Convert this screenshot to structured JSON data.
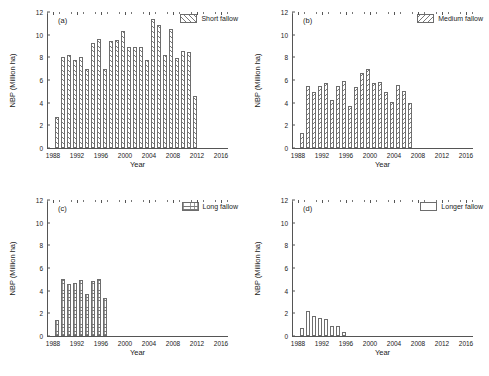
{
  "figure": {
    "axis_labels": {
      "x": "Year",
      "y": "NBP (Million ha)"
    },
    "y_ticks": [
      "0",
      "2",
      "4",
      "6",
      "8",
      "10",
      "12"
    ],
    "x_ticks": [
      "1988",
      "1992",
      "1996",
      "2000",
      "2004",
      "2008",
      "2012",
      "2016"
    ]
  },
  "chart_data": [
    {
      "type": "bar",
      "panel": "(a)",
      "title": "",
      "legend": "Short fallow",
      "hatch": "forward-slash",
      "xlabel": "Year",
      "ylabel": "NBP (Million ha)",
      "xlim": [
        1987,
        2017
      ],
      "ylim": [
        0,
        12
      ],
      "x": [
        1988,
        1989,
        1990,
        1991,
        1992,
        1993,
        1994,
        1995,
        1996,
        1997,
        1998,
        1999,
        2000,
        2001,
        2002,
        2003,
        2004,
        2005,
        2006,
        2007,
        2008,
        2009,
        2010,
        2011
      ],
      "values": [
        2.75,
        8.0,
        8.2,
        7.8,
        8.05,
        6.95,
        9.3,
        9.6,
        6.95,
        9.45,
        9.5,
        10.35,
        8.95,
        8.9,
        8.95,
        7.8,
        11.4,
        10.85,
        8.25,
        10.5,
        7.95,
        8.6,
        8.45,
        4.55
      ]
    },
    {
      "type": "bar",
      "panel": "(b)",
      "title": "",
      "legend": "Medium fallow",
      "hatch": "back-slash",
      "xlabel": "Year",
      "ylabel": "NBP (Million ha)",
      "xlim": [
        1987,
        2017
      ],
      "ylim": [
        0,
        12
      ],
      "x": [
        1988,
        1989,
        1990,
        1991,
        1992,
        1993,
        1994,
        1995,
        1996,
        1997,
        1998,
        1999,
        2000,
        2001,
        2002,
        2003,
        2004,
        2005,
        2006
      ],
      "values": [
        1.35,
        5.5,
        4.9,
        5.45,
        5.75,
        4.2,
        5.45,
        5.95,
        3.75,
        5.35,
        6.6,
        7.0,
        5.7,
        5.85,
        4.9,
        4.1,
        5.6,
        5.0,
        4.0
      ]
    },
    {
      "type": "bar",
      "panel": "(c)",
      "title": "",
      "legend": "Long fallow",
      "hatch": "horizontal-grid",
      "xlabel": "Year",
      "ylabel": "NBP (Million ha)",
      "xlim": [
        1987,
        2017
      ],
      "ylim": [
        0,
        12
      ],
      "x": [
        1988,
        1989,
        1990,
        1991,
        1992,
        1993,
        1994,
        1995,
        1996
      ],
      "values": [
        1.45,
        5.0,
        4.6,
        4.65,
        4.9,
        3.7,
        4.85,
        5.0,
        3.35
      ]
    },
    {
      "type": "bar",
      "panel": "(d)",
      "title": "",
      "legend": "Longer fallow",
      "hatch": "none",
      "xlabel": "Year",
      "ylabel": "NBP (Million ha)",
      "xlim": [
        1987,
        2017
      ],
      "ylim": [
        0,
        12
      ],
      "x": [
        1988,
        1989,
        1990,
        1991,
        1992,
        1993,
        1994,
        1995
      ],
      "values": [
        0.75,
        2.2,
        1.75,
        1.6,
        1.5,
        0.9,
        0.85,
        0.35
      ]
    }
  ]
}
